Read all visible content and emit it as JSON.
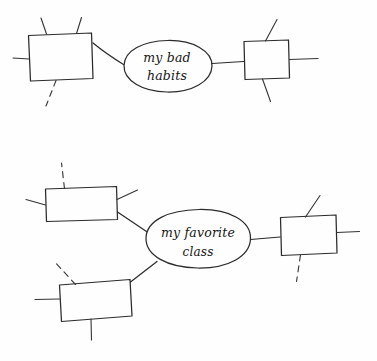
{
  "document": {
    "title": "Hand-drawn concept map sketch",
    "background_color": "#fefefe",
    "ink_color": "#2b2b2b"
  },
  "diagrams": [
    {
      "id": "upper-map",
      "center_label_line1": "my bad",
      "center_label_line2": "habits",
      "center_label_full": "my bad habits",
      "nodes": [
        {
          "id": "upper-left-box",
          "label": "",
          "shape": "rectangle"
        },
        {
          "id": "upper-right-box",
          "label": "",
          "shape": "rectangle"
        }
      ]
    },
    {
      "id": "lower-map",
      "center_label_line1": "my favorite",
      "center_label_line2": "class",
      "center_label_full": "my favorite class",
      "nodes": [
        {
          "id": "lower-upper-left-box",
          "label": "",
          "shape": "rectangle"
        },
        {
          "id": "lower-bottom-left-box",
          "label": "",
          "shape": "rectangle"
        },
        {
          "id": "lower-right-box",
          "label": "",
          "shape": "rectangle"
        }
      ]
    }
  ]
}
